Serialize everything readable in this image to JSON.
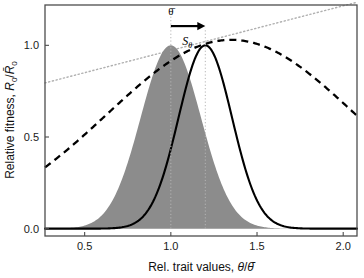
{
  "chart_data": {
    "type": "line",
    "title": "",
    "xlabel": "Rel. trait values, θ/θ̄",
    "ylabel": "Relative fitness, R₀/R̄₀",
    "xlim": [
      0.27,
      2.08
    ],
    "ylim": [
      -0.04,
      1.22
    ],
    "xticks": [
      0.5,
      1.0,
      1.5,
      2.0
    ],
    "xticklabels": [
      "0.5",
      "1.0",
      "1.5",
      "2.0"
    ],
    "yticks": [
      0.0,
      0.5,
      1.0
    ],
    "yticklabels": [
      "0.0",
      "0.5",
      "1.0"
    ],
    "grid": false,
    "legend": "none",
    "series": [
      {
        "name": "trait distribution before selection (shaded)",
        "style": "filled-area",
        "color": "#8c8c8c",
        "kind": "gaussian",
        "mean": 1.0,
        "sd": 0.175,
        "peak": 1.0
      },
      {
        "name": "trait distribution after selection",
        "style": "solid",
        "color": "#000000",
        "kind": "gaussian",
        "mean": 1.2,
        "sd": 0.155,
        "peak": 1.0
      },
      {
        "name": "fitness landscape",
        "style": "dashed",
        "color": "#000000",
        "kind": "gaussian",
        "mean": 1.35,
        "sd": 0.72,
        "peak": 1.03
      },
      {
        "name": "fitness gradient tangent",
        "style": "dotted",
        "color": "#b0b0b0",
        "kind": "line",
        "points": [
          [
            0.27,
            0.795
          ],
          [
            2.08,
            1.235
          ]
        ]
      }
    ],
    "annotations": [
      {
        "name": "mean-trait-label",
        "text": "θ̄",
        "x": 1.0,
        "y": 1.165
      },
      {
        "name": "selection-differential-label",
        "text": "S",
        "subscript": "θ",
        "x": 1.095,
        "y": 1.0
      },
      {
        "name": "selection-arrow",
        "from_x": 1.0,
        "to_x": 1.2,
        "y": 1.105
      },
      {
        "name": "guide-line-before",
        "x": 1.0,
        "y_from": 0.0,
        "y_to": 1.16
      },
      {
        "name": "guide-line-after",
        "x": 1.2,
        "y_from": 0.0,
        "y_to": 1.095
      }
    ]
  },
  "axes": {
    "x_title": "Rel. trait values, θ/θ̄",
    "y_title_parts": {
      "prefix": "Relative fitness, ",
      "numer": "R",
      "numer_sub": "0",
      "slash": "/",
      "denom": "R̄",
      "denom_sub": "0"
    },
    "x_tick_labels": [
      "0.5",
      "1.0",
      "1.5",
      "2.0"
    ],
    "y_tick_labels": [
      "0.0",
      "0.5",
      "1.0"
    ]
  },
  "colors": {
    "shaded_distribution": "#8c8c8c",
    "solid_curve": "#000000",
    "dashed_curve": "#000000",
    "dotted_line": "#b0b0b0",
    "frame": "#4d4d4d",
    "text": "#111111",
    "background": "#ffffff"
  }
}
